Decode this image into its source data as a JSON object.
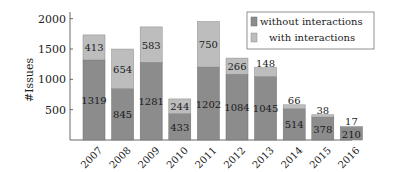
{
  "chart_data": {
    "type": "bar",
    "stacked": true,
    "title": "",
    "xlabel": "",
    "ylabel": "#Issues",
    "ylim": [
      0,
      2100
    ],
    "yticks": [
      500,
      1000,
      1500,
      2000
    ],
    "grid": false,
    "legend_position": "top-right",
    "categories": [
      "2007",
      "2008",
      "2009",
      "2010",
      "2011",
      "2012",
      "2013",
      "2014",
      "2015",
      "2016"
    ],
    "series": [
      {
        "name": "without interactions",
        "color": "#8c8c8c",
        "values": [
          1319,
          845,
          1281,
          433,
          1202,
          1084,
          1045,
          514,
          378,
          210
        ]
      },
      {
        "name": "with interactions",
        "color": "#bdbdbd",
        "values": [
          413,
          654,
          583,
          244,
          750,
          266,
          148,
          66,
          38,
          17
        ]
      }
    ]
  }
}
